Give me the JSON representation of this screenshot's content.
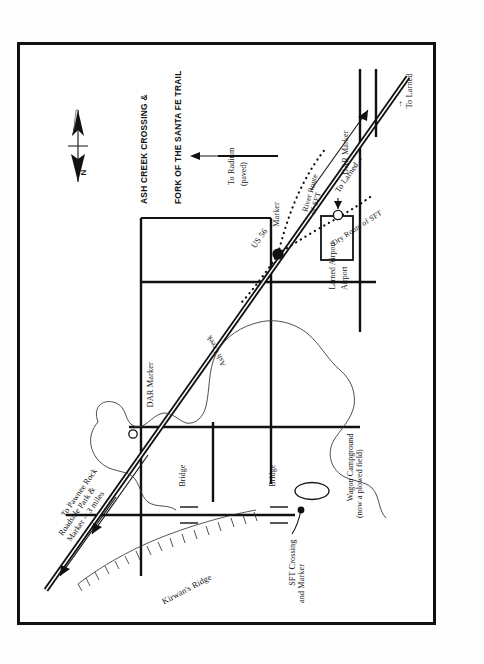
{
  "map": {
    "title_lines": [
      "ASH CREEK CROSSING &",
      "FORK OF THE SANTA FE TRAIL"
    ],
    "compass": {
      "north_label": "N"
    },
    "labels": {
      "kirwans_ridge": "Kirwan's Ridge",
      "to_pawnee_rock": "To Pawnee Rock\nRoadside Park &\nMarker -- 3 miles",
      "dar_marker_north": "DAR Marker",
      "bridge_north": "Bridge",
      "ash_creek": "Ash Creek",
      "sft_crossing": "SFT Crossing\nand Marker",
      "bridge_south": "Bridge",
      "wagon_campground": "Wagon Campground\n(now a plowed field)",
      "us_56": "US 56",
      "to_radium": "To Radium",
      "paved": "(paved)",
      "to_larned_hwy": "To Larned",
      "marker": "Marker",
      "river_route": "River Route\nof SFT",
      "dry_route": "Dry Route of SFT",
      "larned_airport": "Larned Airport",
      "airport": "Airport",
      "dar_marker_south": "DAR Marker",
      "to_larned_bottom": "To Larned"
    },
    "arrows": {
      "to_radium_arrow": "→",
      "to_larned_hwy_arrow": "→",
      "to_larned_bottom_arrow": "→"
    },
    "colors": {
      "ink": "#111111",
      "paper": "#ffffff",
      "creek": "#3b3b3b"
    }
  }
}
